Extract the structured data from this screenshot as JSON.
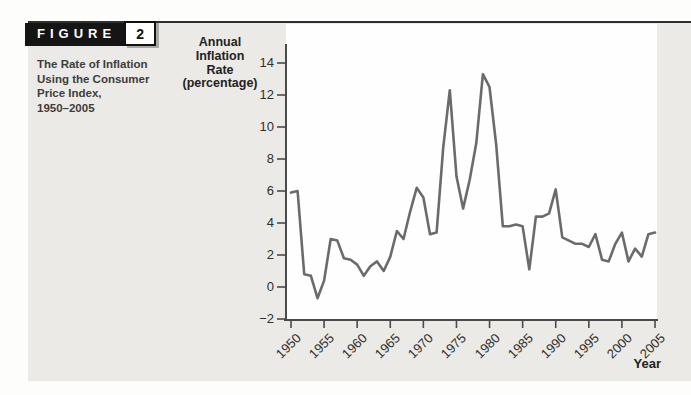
{
  "figure": {
    "tag_label": "FIGURE",
    "tag_number": "2",
    "caption": "The Rate of Inflation\nUsing the Consumer\nPrice Index,\n1950–2005"
  },
  "chart_data": {
    "type": "line",
    "title": "",
    "ylabel": "Annual\nInflation\nRate\n(percentage)",
    "xlabel": "Year",
    "ylim": [
      -2,
      14
    ],
    "yticks": [
      14,
      12,
      10,
      8,
      6,
      4,
      2,
      0,
      -2
    ],
    "x_start": 1950,
    "x_end": 2005,
    "x_tick_years": [
      1950,
      1955,
      1960,
      1965,
      1970,
      1975,
      1980,
      1985,
      1990,
      1995,
      2000,
      2005
    ],
    "grid": false,
    "legend": "none",
    "years": [
      1950,
      1951,
      1952,
      1953,
      1954,
      1955,
      1956,
      1957,
      1958,
      1959,
      1960,
      1961,
      1962,
      1963,
      1964,
      1965,
      1966,
      1967,
      1968,
      1969,
      1970,
      1971,
      1972,
      1973,
      1974,
      1975,
      1976,
      1977,
      1978,
      1979,
      1980,
      1981,
      1982,
      1983,
      1984,
      1985,
      1986,
      1987,
      1988,
      1989,
      1990,
      1991,
      1992,
      1993,
      1994,
      1995,
      1996,
      1997,
      1998,
      1999,
      2000,
      2001,
      2002,
      2003,
      2004,
      2005
    ],
    "values": [
      5.9,
      6.0,
      0.8,
      0.7,
      -0.7,
      0.4,
      3.0,
      2.9,
      1.8,
      1.7,
      1.4,
      0.7,
      1.3,
      1.6,
      1.0,
      1.9,
      3.5,
      3.0,
      4.7,
      6.2,
      5.6,
      3.3,
      3.4,
      8.7,
      12.3,
      6.9,
      4.9,
      6.7,
      9.0,
      13.3,
      12.5,
      8.9,
      3.8,
      3.8,
      3.9,
      3.8,
      1.1,
      4.4,
      4.4,
      4.6,
      6.1,
      3.1,
      2.9,
      2.7,
      2.7,
      2.5,
      3.3,
      1.7,
      1.6,
      2.7,
      3.4,
      1.6,
      2.4,
      1.9,
      3.3,
      3.4
    ]
  },
  "colors": {
    "page_bg": "#fdfdfb",
    "panel_bg": "#eceae6",
    "plot_bg": "#fefefe",
    "rule": "#2f2f2f",
    "tag_bg": "#151515",
    "tag_text": "#ffffff",
    "line": "#6b6b6b",
    "axis": "#4a4a4a",
    "text": "#2f2f2f"
  }
}
